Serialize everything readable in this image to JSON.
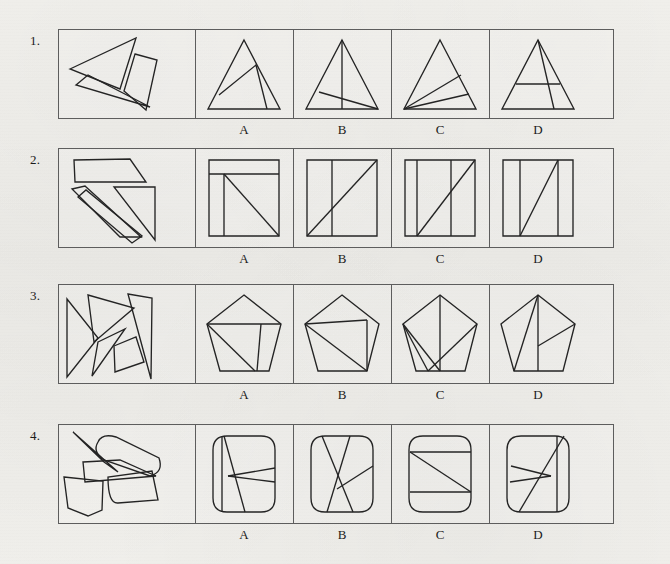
{
  "page": {
    "kind": "visual-reasoning-worksheet",
    "width": 670,
    "height": 564,
    "ink_color": "#242424",
    "frame_color": "#5d5d5d",
    "paper_color": "#f2f1ed"
  },
  "layout": {
    "frame_left": 0,
    "frame_width": 556,
    "stimulus_width": 137,
    "option_width": 98,
    "divider_offsets": [
      137,
      235,
      333,
      431
    ],
    "option_label_offsets": [
      186,
      284,
      382,
      480
    ]
  },
  "option_labels": [
    "A",
    "B",
    "C",
    "D"
  ],
  "rows": [
    {
      "number": "1.",
      "number_x": 30,
      "number_y": 33,
      "top": 29,
      "height": 90,
      "label_y": 122,
      "shape_family": "triangle",
      "stimulus_name": "scattered-triangle-pieces",
      "options": [
        {
          "letter": "A",
          "name": "triangle-option-a"
        },
        {
          "letter": "B",
          "name": "triangle-option-b"
        },
        {
          "letter": "C",
          "name": "triangle-option-c"
        },
        {
          "letter": "D",
          "name": "triangle-option-d"
        }
      ]
    },
    {
      "number": "2.",
      "number_x": 30,
      "number_y": 152,
      "top": 148,
      "height": 100,
      "label_y": 251,
      "shape_family": "square",
      "stimulus_name": "scattered-square-pieces",
      "options": [
        {
          "letter": "A",
          "name": "square-option-a"
        },
        {
          "letter": "B",
          "name": "square-option-b"
        },
        {
          "letter": "C",
          "name": "square-option-c"
        },
        {
          "letter": "D",
          "name": "square-option-d"
        }
      ]
    },
    {
      "number": "3.",
      "number_x": 30,
      "number_y": 288,
      "top": 284,
      "height": 100,
      "label_y": 387,
      "shape_family": "pentagon",
      "stimulus_name": "scattered-pentagon-pieces",
      "options": [
        {
          "letter": "A",
          "name": "pentagon-option-a"
        },
        {
          "letter": "B",
          "name": "pentagon-option-b"
        },
        {
          "letter": "C",
          "name": "pentagon-option-c"
        },
        {
          "letter": "D",
          "name": "pentagon-option-d"
        }
      ]
    },
    {
      "number": "4.",
      "number_x": 30,
      "number_y": 428,
      "top": 424,
      "height": 100,
      "label_y": 527,
      "shape_family": "rounded-square",
      "stimulus_name": "scattered-rounded-square-pieces",
      "options": [
        {
          "letter": "A",
          "name": "rounded-square-option-a"
        },
        {
          "letter": "B",
          "name": "rounded-square-option-b"
        },
        {
          "letter": "C",
          "name": "rounded-square-option-c"
        },
        {
          "letter": "D",
          "name": "rounded-square-option-d"
        }
      ]
    }
  ],
  "figures": {
    "r1_stimulus": {
      "viewbox": "0 0 137 90",
      "paths": [
        "M 12 40 L 78 9 L 62 60 Z",
        "M 18 56 L 30 46 L 92 78 Z",
        "M 77 25 L 99 31 L 88 81 L 66 62 Z"
      ]
    },
    "r1_a": {
      "viewbox": "0 0 98 90",
      "paths": [
        "M 49 11 L 85 80 L 13 80 Z",
        "M 24 66 L 61 36 L 72 80"
      ]
    },
    "r1_b": {
      "viewbox": "0 0 98 90",
      "paths": [
        "M 49 11 L 85 80 L 13 80 Z",
        "M 49 11 L 49 80",
        "M 26 63 L 85 80"
      ]
    },
    "r1_c": {
      "viewbox": "0 0 98 90",
      "paths": [
        "M 49 11 L 85 80 L 13 80 Z",
        "M 13 80 L 70 46",
        "M 13 80 L 78 65"
      ]
    },
    "r1_d": {
      "viewbox": "0 0 98 90",
      "paths": [
        "M 49 11 L 85 80 L 13 80 Z",
        "M 27 55 L 71 55",
        "M 49 11 L 65 80"
      ]
    },
    "r2_stimulus": {
      "viewbox": "0 0 137 100",
      "paths": [
        "M 16 12 L 72 11 L 88 34 L 17 34 Z",
        "M 14 41 L 27 38 L 83 89 L 62 89 Z",
        "M 20 49 L 28 42 L 84 88 L 74 95 Z",
        "M 56 39 L 97 39 L 97 92 Z"
      ]
    },
    "r2_a": {
      "viewbox": "0 0 98 100",
      "paths": [
        "M 14 12 L 84 12 L 84 88 L 14 88 Z",
        "M 14 26 L 84 26",
        "M 29 26 L 29 88",
        "M 29 26 L 84 88"
      ]
    },
    "r2_b": {
      "viewbox": "0 0 98 100",
      "paths": [
        "M 14 12 L 84 12 L 84 88 L 14 88 Z",
        "M 39 12 L 39 88",
        "M 14 88 L 84 12"
      ]
    },
    "r2_c": {
      "viewbox": "0 0 98 100",
      "paths": [
        "M 14 12 L 84 12 L 84 88 L 14 88 Z",
        "M 26 12 L 26 88",
        "M 60 12 L 60 88",
        "M 26 88 L 84 12"
      ]
    },
    "r2_d": {
      "viewbox": "0 0 98 100",
      "paths": [
        "M 14 12 L 84 12 L 84 88 L 14 88 Z",
        "M 31 12 L 31 88",
        "M 69 12 L 69 88",
        "M 31 88 L 69 12"
      ]
    },
    "r3_stimulus": {
      "viewbox": "0 0 137 100",
      "paths": [
        "M 9 15 L 40 54 L 9 93 Z",
        "M 30 11 L 76 24 L 36 58 Z",
        "M 40 58 L 67 45 L 34 92 Z",
        "M 70 10 L 94 14 L 93 95 Z",
        "M 56 62 L 78 53 L 86 78 L 57 88 Z"
      ]
    },
    "r3_a": {
      "viewbox": "0 0 98 100",
      "paths": [
        "M 49 11 L 86 40 L 74 87 L 25 87 L 12 40 Z",
        "M 12 40 L 86 40",
        "M 12 40 L 60 87",
        "M 66 40 L 62 87"
      ]
    },
    "r3_b": {
      "viewbox": "0 0 98 100",
      "paths": [
        "M 49 11 L 86 40 L 74 87 L 25 87 L 12 40 Z",
        "M 12 40 L 74 36",
        "M 12 40 L 74 87",
        "M 74 36 L 74 87"
      ]
    },
    "r3_c": {
      "viewbox": "0 0 98 100",
      "paths": [
        "M 49 11 L 86 40 L 74 87 L 25 87 L 12 40 Z",
        "M 49 11 L 49 87",
        "M 12 40 L 49 87",
        "M 86 40 L 37 87",
        "M 12 40 L 37 87"
      ]
    },
    "r3_d": {
      "viewbox": "0 0 98 100",
      "paths": [
        "M 49 11 L 86 40 L 74 87 L 25 87 L 12 40 Z",
        "M 49 11 L 49 87",
        "M 49 11 L 25 87",
        "M 86 40 L 49 62"
      ]
    },
    "r4_stimulus": {
      "viewbox": "0 0 137 100",
      "paths": [
        "M 15 8 L 60 48 L 46 38 Z",
        "M 40 18 Q 34 28 46 36 L 92 52 Q 106 48 101 34 L 58 13 Q 44 9 40 18 Z",
        "M 25 38 L 62 36 L 98 52 L 27 58 Z",
        "M 6 53 L 45 57 L 44 86 L 30 92 L 10 84 Z",
        "M 50 53 Q 50 80 60 79 L 100 76 L 94 47 Z"
      ]
    },
    "r4_a": {
      "viewbox": "0 0 98 100",
      "paths": [
        "M 32 12 L 66 12 Q 80 12 80 26 L 80 74 Q 80 88 66 88 L 32 88 Q 18 88 18 74 L 18 26 Q 18 12 32 12 Z",
        "M 27 12 L 27 88",
        "M 29 12 L 50 88",
        "M 33 52 L 80 44",
        "M 33 52 L 80 58"
      ]
    },
    "r4_b": {
      "viewbox": "0 0 98 100",
      "paths": [
        "M 32 12 L 66 12 Q 80 12 80 26 L 80 74 Q 80 88 66 88 L 32 88 Q 18 88 18 74 L 18 26 Q 18 12 32 12 Z",
        "M 29 12 L 60 88",
        "M 57 12 L 34 88",
        "M 44 65 L 80 42"
      ]
    },
    "r4_c": {
      "viewbox": "0 0 98 100",
      "paths": [
        "M 32 12 L 66 12 Q 80 12 80 26 L 80 74 Q 80 88 66 88 L 32 88 Q 18 88 18 74 L 18 26 Q 18 12 32 12 Z",
        "M 19 28 L 80 28",
        "M 19 68 L 80 68",
        "M 19 28 L 80 68"
      ]
    },
    "r4_d": {
      "viewbox": "0 0 98 100",
      "paths": [
        "M 32 12 L 66 12 Q 80 12 80 26 L 80 74 Q 80 88 66 88 L 32 88 Q 18 88 18 74 L 18 26 Q 18 12 32 12 Z",
        "M 68 12 L 68 88",
        "M 22 42 L 62 52",
        "M 21 58 L 62 52",
        "M 30 88 L 75 12"
      ]
    }
  }
}
